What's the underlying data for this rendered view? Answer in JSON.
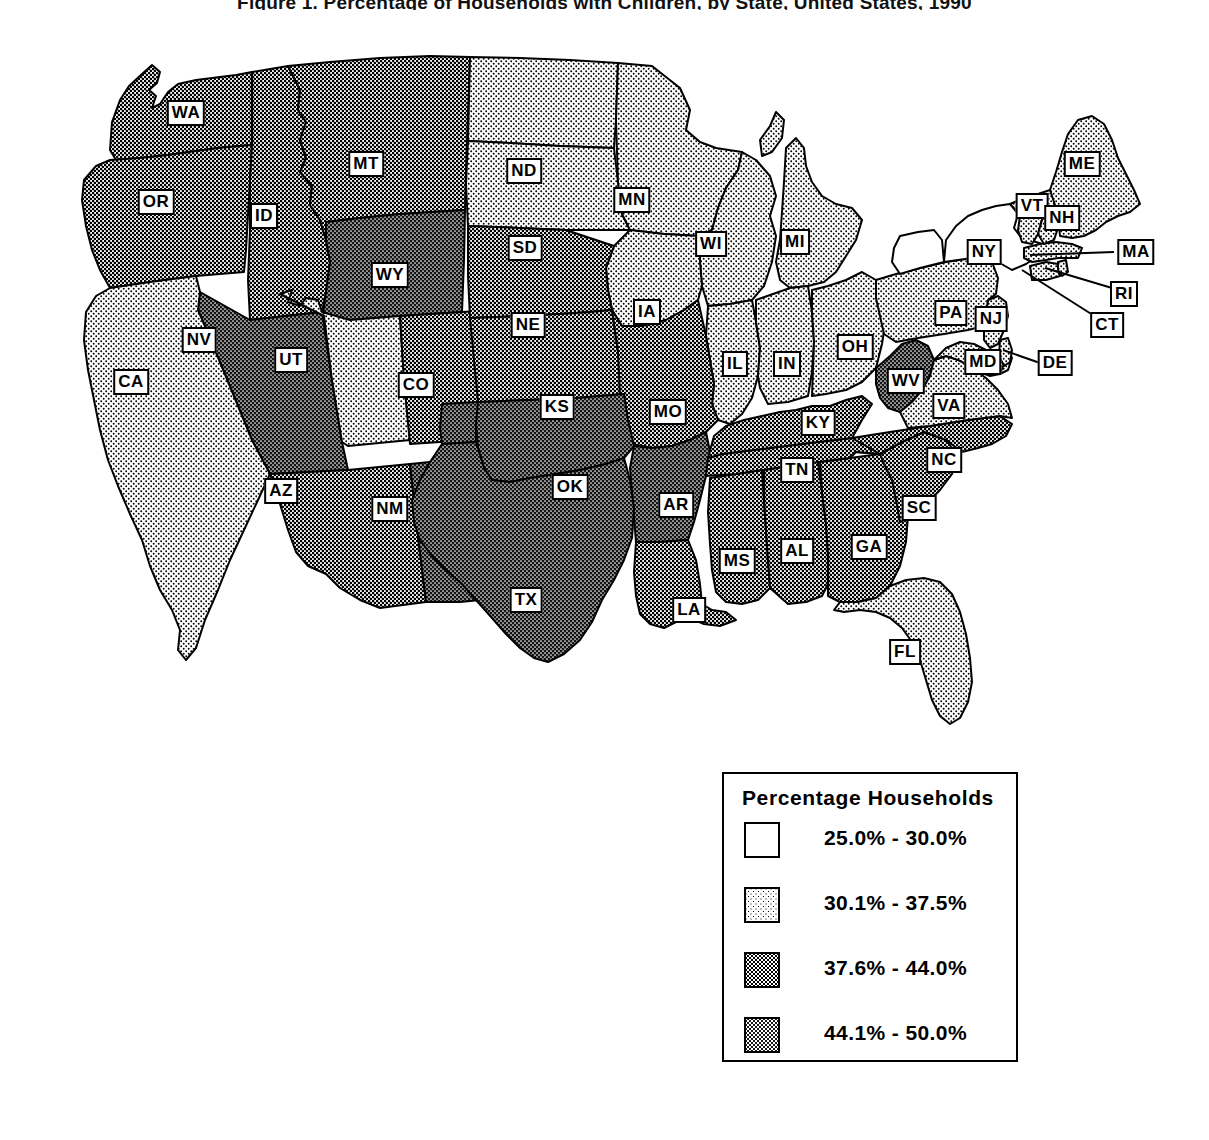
{
  "title": "Figure 1. Percentage of Households with Children, by State, United States, 1990",
  "legend": {
    "title": "Percentage Households",
    "classes": [
      {
        "id": "c0",
        "label": "25.0% - 30.0%",
        "swatch": "white",
        "hex": "#ffffff"
      },
      {
        "id": "c1",
        "label": "30.1% - 37.5%",
        "swatch": "light-stipple",
        "hex": "#d6d6d6"
      },
      {
        "id": "c2",
        "label": "37.6% - 44.0%",
        "swatch": "mid-stipple",
        "hex": "#8c8c8c"
      },
      {
        "id": "c3",
        "label": "44.1% - 50.0%",
        "swatch": "dark-stipple",
        "hex": "#2e2e2e"
      }
    ]
  },
  "map": {
    "projection": "albers-usa",
    "outline_color": "#000000",
    "background": "#ffffff",
    "states": [
      {
        "code": "WA",
        "class": "c2",
        "lx": 186,
        "ly": 113
      },
      {
        "code": "OR",
        "class": "c2",
        "lx": 156,
        "ly": 202
      },
      {
        "code": "ID",
        "class": "c2",
        "lx": 264,
        "ly": 216
      },
      {
        "code": "MT",
        "class": "c2",
        "lx": 366,
        "ly": 164
      },
      {
        "code": "WY",
        "class": "c3",
        "lx": 390,
        "ly": 275
      },
      {
        "code": "ND",
        "class": "c1",
        "lx": 524,
        "ly": 171
      },
      {
        "code": "SD",
        "class": "c1",
        "lx": 525,
        "ly": 248
      },
      {
        "code": "MN",
        "class": "c1",
        "lx": 632,
        "ly": 200
      },
      {
        "code": "WI",
        "class": "c1",
        "lx": 711,
        "ly": 244
      },
      {
        "code": "MI",
        "class": "c1",
        "lx": 795,
        "ly": 242
      },
      {
        "code": "IA",
        "class": "c1",
        "lx": 647,
        "ly": 312
      },
      {
        "code": "IL",
        "class": "c1",
        "lx": 735,
        "ly": 364
      },
      {
        "code": "IN",
        "class": "c1",
        "lx": 787,
        "ly": 364
      },
      {
        "code": "OH",
        "class": "c1",
        "lx": 855,
        "ly": 347
      },
      {
        "code": "NE",
        "class": "c2",
        "lx": 528,
        "ly": 325
      },
      {
        "code": "KS",
        "class": "c2",
        "lx": 557,
        "ly": 407
      },
      {
        "code": "MO",
        "class": "c2",
        "lx": 668,
        "ly": 412
      },
      {
        "code": "NV",
        "class": "c3",
        "lx": 199,
        "ly": 340
      },
      {
        "code": "UT",
        "class": "c1",
        "lx": 291,
        "ly": 360
      },
      {
        "code": "CA",
        "class": "c1",
        "lx": 131,
        "ly": 382
      },
      {
        "code": "CO",
        "class": "c2",
        "lx": 416,
        "ly": 385
      },
      {
        "code": "AZ",
        "class": "c2",
        "lx": 281,
        "ly": 491
      },
      {
        "code": "NM",
        "class": "c3",
        "lx": 390,
        "ly": 509
      },
      {
        "code": "OK",
        "class": "c3",
        "lx": 570,
        "ly": 487
      },
      {
        "code": "AR",
        "class": "c3",
        "lx": 676,
        "ly": 505
      },
      {
        "code": "TX",
        "class": "c3",
        "lx": 526,
        "ly": 600
      },
      {
        "code": "LA",
        "class": "c2",
        "lx": 689,
        "ly": 610
      },
      {
        "code": "MS",
        "class": "c2",
        "lx": 737,
        "ly": 561
      },
      {
        "code": "AL",
        "class": "c2",
        "lx": 797,
        "ly": 551
      },
      {
        "code": "GA",
        "class": "c2",
        "lx": 869,
        "ly": 547
      },
      {
        "code": "FL",
        "class": "c1",
        "lx": 905,
        "ly": 652
      },
      {
        "code": "SC",
        "class": "c2",
        "lx": 919,
        "ly": 508
      },
      {
        "code": "NC",
        "class": "c2",
        "lx": 944,
        "ly": 460
      },
      {
        "code": "TN",
        "class": "c2",
        "lx": 797,
        "ly": 470
      },
      {
        "code": "KY",
        "class": "c2",
        "lx": 818,
        "ly": 423
      },
      {
        "code": "WV",
        "class": "c3",
        "lx": 906,
        "ly": 381
      },
      {
        "code": "VA",
        "class": "c1",
        "lx": 949,
        "ly": 406
      },
      {
        "code": "MD",
        "class": "c1",
        "lx": 983,
        "ly": 362
      },
      {
        "code": "DE",
        "class": "c1",
        "lx": 1055,
        "ly": 363
      },
      {
        "code": "NJ",
        "class": "c1",
        "lx": 991,
        "ly": 319
      },
      {
        "code": "PA",
        "class": "c1",
        "lx": 951,
        "ly": 313
      },
      {
        "code": "NY",
        "class": "c0",
        "lx": 984,
        "ly": 252
      },
      {
        "code": "CT",
        "class": "c1",
        "lx": 1107,
        "ly": 325
      },
      {
        "code": "RI",
        "class": "c1",
        "lx": 1124,
        "ly": 294
      },
      {
        "code": "MA",
        "class": "c1",
        "lx": 1136,
        "ly": 252
      },
      {
        "code": "VT",
        "class": "c1",
        "lx": 1032,
        "ly": 206
      },
      {
        "code": "NH",
        "class": "c1",
        "lx": 1062,
        "ly": 218
      },
      {
        "code": "ME",
        "class": "c1",
        "lx": 1082,
        "ly": 164
      }
    ],
    "leader_lines": [
      {
        "code": "MA",
        "x1": 1114,
        "y1": 252,
        "x2": 1030,
        "y2": 255
      },
      {
        "code": "RI",
        "x1": 1112,
        "y1": 288,
        "x2": 1045,
        "y2": 268
      },
      {
        "code": "CT",
        "x1": 1096,
        "y1": 317,
        "x2": 1022,
        "y2": 270
      },
      {
        "code": "DE",
        "x1": 1040,
        "y1": 363,
        "x2": 1003,
        "y2": 350
      }
    ]
  }
}
